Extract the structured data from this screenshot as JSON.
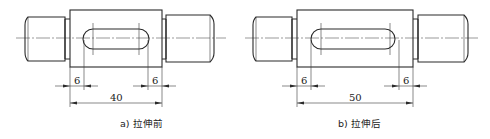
{
  "figures": [
    {
      "id": "a",
      "caption": "a) 拉伸前",
      "state": "before stretching",
      "dimensions": {
        "left_offset": "6",
        "right_offset": "6",
        "body_length": "40"
      }
    },
    {
      "id": "b",
      "caption": "b) 拉伸后",
      "state": "after stretching",
      "dimensions": {
        "left_offset": "6",
        "right_offset": "6",
        "body_length": "50"
      }
    }
  ],
  "colors": {
    "line": "#2a2a2a",
    "background": "#ffffff"
  }
}
